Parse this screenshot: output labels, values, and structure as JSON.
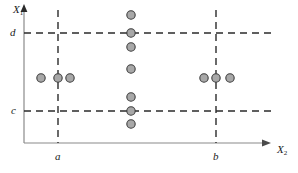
{
  "chart_data": {
    "type": "scatter",
    "title": "",
    "xlabel": "X2",
    "ylabel": "X1",
    "xlabel_base": "X",
    "xlabel_sub": "2",
    "ylabel_base": "X",
    "ylabel_sub": "1",
    "xlim": [
      0,
      298
    ],
    "ylim": [
      0,
      173
    ],
    "grid": false,
    "legend": null,
    "axes": {
      "x_axis_y": 143,
      "y_axis_x": 24,
      "x_axis_end": 262,
      "y_axis_top": 8,
      "origin": [
        24,
        143
      ]
    },
    "reference_lines": [
      {
        "id": "a",
        "label": "a",
        "orientation": "vertical",
        "value": 58,
        "style": "dashed",
        "from": 10,
        "to": 143
      },
      {
        "id": "b",
        "label": "b",
        "orientation": "vertical",
        "value": 216,
        "style": "dashed",
        "from": 10,
        "to": 143
      },
      {
        "id": "c",
        "label": "c",
        "orientation": "horizontal",
        "value": 111,
        "style": "dashed",
        "from": 24,
        "to": 271
      },
      {
        "id": "d",
        "label": "d",
        "orientation": "horizontal",
        "value": 33,
        "style": "dashed",
        "from": 24,
        "to": 271
      }
    ],
    "tick_labels": {
      "x": [
        {
          "label": "a",
          "x": 58
        },
        {
          "label": "b",
          "x": 216
        }
      ],
      "y": [
        {
          "label": "c",
          "y": 111
        },
        {
          "label": "d",
          "y": 33
        }
      ]
    },
    "point_style": {
      "fill": "#a8a8a8",
      "stroke": "#3d3d3d",
      "radius": 4.2,
      "stroke_width": 1.1
    },
    "points": [
      {
        "x": 41,
        "y": 78,
        "group": "left"
      },
      {
        "x": 58,
        "y": 78,
        "group": "left"
      },
      {
        "x": 70,
        "y": 78,
        "group": "left"
      },
      {
        "x": 131,
        "y": 15,
        "group": "center"
      },
      {
        "x": 131,
        "y": 33,
        "group": "center"
      },
      {
        "x": 131,
        "y": 47,
        "group": "center"
      },
      {
        "x": 131,
        "y": 69,
        "group": "center"
      },
      {
        "x": 131,
        "y": 97,
        "group": "center"
      },
      {
        "x": 131,
        "y": 111,
        "group": "center"
      },
      {
        "x": 131,
        "y": 124,
        "group": "center"
      },
      {
        "x": 204,
        "y": 78,
        "group": "right"
      },
      {
        "x": 216,
        "y": 78,
        "group": "right"
      },
      {
        "x": 230,
        "y": 78,
        "group": "right"
      }
    ],
    "colors": {
      "axis": "#8a8a8a",
      "dash": "#2b2b2b",
      "text": "#1a1a1a",
      "point_fill": "#a8a8a8",
      "point_stroke": "#3d3d3d",
      "background": "#ffffff"
    }
  }
}
